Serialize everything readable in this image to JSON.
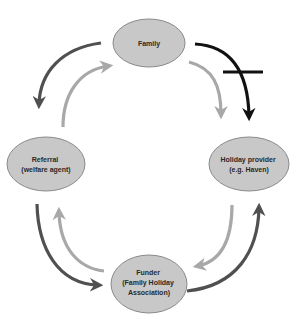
{
  "diagram": {
    "type": "cycle-flow",
    "nodes": {
      "family": {
        "lines": [
          "Family"
        ]
      },
      "referral": {
        "lines": [
          "Referral",
          "(welfare agent)"
        ]
      },
      "holiday_provider": {
        "lines": [
          "Holiday provider",
          "(e.g. Haven)"
        ]
      },
      "funder": {
        "lines": [
          "Funder",
          "(Family Holiday",
          "Association)"
        ]
      }
    },
    "edges": [
      {
        "from": "family",
        "to": "referral",
        "shade": "dark"
      },
      {
        "from": "referral",
        "to": "family",
        "shade": "light"
      },
      {
        "from": "family",
        "to": "holiday_provider",
        "shade": "light"
      },
      {
        "from": "family",
        "to": "holiday_provider",
        "shade": "black",
        "blocked": true
      },
      {
        "from": "referral",
        "to": "funder",
        "shade": "dark"
      },
      {
        "from": "funder",
        "to": "referral",
        "shade": "light"
      },
      {
        "from": "holiday_provider",
        "to": "funder",
        "shade": "light"
      },
      {
        "from": "funder",
        "to": "holiday_provider",
        "shade": "dark"
      }
    ],
    "colors": {
      "node_fill": "#c8c8c8",
      "node_stroke": "#8a8a8a",
      "arrow_dark": "#505050",
      "arrow_light": "#a8a8a8",
      "arrow_black": "#111111"
    }
  }
}
